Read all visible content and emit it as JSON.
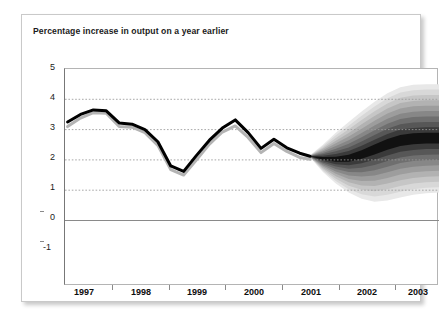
{
  "figure": {
    "title": "Percentage increase in output on a year earlier",
    "background_color": "#ffffff",
    "frame_color": "#c9c9c9"
  },
  "chart_data": {
    "type": "area",
    "chart_style": "fan-chart",
    "title": "Percentage increase in output on a year earlier",
    "xlabel": "",
    "ylabel": "",
    "ylim": [
      -1,
      5
    ],
    "xlim": [
      1996.5,
      2003.75
    ],
    "yticks": [
      5,
      4,
      3,
      2,
      1,
      0,
      -1
    ],
    "ytick_labels": [
      "5",
      "4",
      "3",
      "2",
      "1",
      "0",
      "-1"
    ],
    "xticks": [
      1997,
      1998,
      1999,
      2000,
      2001,
      2002,
      2003
    ],
    "xtick_labels": [
      "1997",
      "1998",
      "1999",
      "2000",
      "2001",
      "2002",
      "2003"
    ],
    "grid": "horizontal-dotted",
    "gridline_values": [
      4,
      3,
      2,
      1
    ],
    "zero_line_value": 0,
    "legend": "none",
    "forecast_start_x": 2001.25,
    "series": [
      {
        "name": "GDP growth (black line)",
        "color": "#000000",
        "x": [
          1996.55,
          1996.8,
          1997.05,
          1997.3,
          1997.55,
          1997.8,
          1998.05,
          1998.3,
          1998.55,
          1998.8,
          1999.05,
          1999.3,
          1999.55,
          1999.8,
          2000.05,
          2000.3,
          2000.55,
          2000.8,
          2001.05,
          2001.25
        ],
        "values": [
          3.25,
          3.5,
          3.65,
          3.62,
          3.22,
          3.18,
          3.0,
          2.6,
          1.8,
          1.62,
          2.15,
          2.65,
          3.05,
          3.32,
          2.9,
          2.38,
          2.68,
          2.4,
          2.22,
          2.12
        ]
      },
      {
        "name": "GDP growth at basic prices (grey line)",
        "color": "#b0b0b0",
        "x": [
          1996.55,
          1996.8,
          1997.05,
          1997.3,
          1997.55,
          1997.8,
          1998.05,
          1998.3,
          1998.55,
          1998.8,
          1999.05,
          1999.3,
          1999.55,
          1999.8,
          2000.05,
          2000.3,
          2000.55,
          2000.8,
          2001.05,
          2001.25
        ],
        "values": [
          3.1,
          3.38,
          3.56,
          3.54,
          3.1,
          3.08,
          2.9,
          2.48,
          1.68,
          1.5,
          2.0,
          2.52,
          2.92,
          3.12,
          2.74,
          2.24,
          2.54,
          2.28,
          2.08,
          2.02
        ]
      }
    ],
    "fan": {
      "description": "Probability fan for forecast, darkest band = central projection, lighter shades = wider probability intervals",
      "start_x": 2001.25,
      "end_x": 2003.75,
      "central_start": 2.12,
      "central_end": 2.7,
      "band_shades": [
        "#111111",
        "#3a3a3a",
        "#575757",
        "#6f6f6f",
        "#878787",
        "#9d9d9d",
        "#b2b2b2",
        "#c6c6c6",
        "#d8d8d8",
        "#e8e8e8"
      ],
      "x": [
        2001.25,
        2001.5,
        2001.75,
        2002.0,
        2002.25,
        2002.5,
        2002.75,
        2003.0,
        2003.25,
        2003.5,
        2003.75
      ],
      "central": [
        2.12,
        2.05,
        2.02,
        2.05,
        2.18,
        2.35,
        2.52,
        2.65,
        2.7,
        2.72,
        2.72
      ],
      "widest_upper": [
        2.15,
        2.5,
        2.9,
        3.25,
        3.6,
        3.92,
        4.2,
        4.4,
        4.48,
        4.5,
        4.5
      ],
      "widest_lower": [
        2.09,
        1.6,
        1.22,
        0.92,
        0.72,
        0.62,
        0.66,
        0.76,
        0.85,
        0.9,
        0.92
      ]
    }
  },
  "axis_labels": {
    "y": [
      "5",
      "4",
      "3",
      "2",
      "1",
      "0",
      "-1"
    ],
    "x": [
      "1997",
      "1998",
      "1999",
      "2000",
      "2001",
      "2002",
      "2003"
    ]
  }
}
